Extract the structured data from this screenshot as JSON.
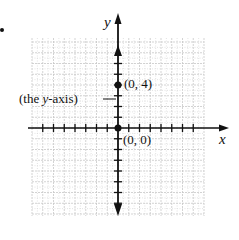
{
  "figure": {
    "bullet": "•",
    "x_axis_label": "x",
    "y_axis_label": "y",
    "annotation": {
      "prefix": "(the ",
      "var": "y",
      "suffix": "-axis)"
    },
    "points": [
      {
        "label": "(0, 4)",
        "x": 0,
        "y": 4
      },
      {
        "label": "(0, 0)",
        "x": 0,
        "y": 0
      }
    ],
    "grid": {
      "xmin": -8,
      "xmax": 8,
      "ymin": -8,
      "ymax": 8,
      "line_color": "#c8c8c8",
      "minor_color": "#dcdcdc"
    },
    "axis_color": "#111111"
  }
}
